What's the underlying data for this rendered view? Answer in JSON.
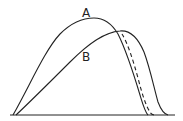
{
  "diagram": {
    "type": "curve-comparison",
    "labels": {
      "curve_a": "A",
      "curve_b": "B"
    },
    "curves": [
      {
        "name": "A",
        "style": "solid",
        "start": [
          13,
          115
        ],
        "peak": [
          92,
          18
        ],
        "end": [
          148,
          115
        ]
      },
      {
        "name": "B",
        "style": "solid",
        "start": [
          16,
          115
        ],
        "peak": [
          122,
          32
        ],
        "end": [
          168,
          115
        ]
      },
      {
        "name": "intermediate",
        "style": "dashed",
        "start": [
          120,
          35
        ],
        "end": [
          155,
          115
        ]
      }
    ],
    "baseline": {
      "y": 115,
      "x_start": 10,
      "x_end": 175
    },
    "colors": {
      "stroke": "#222222",
      "background": "#ffffff"
    }
  }
}
